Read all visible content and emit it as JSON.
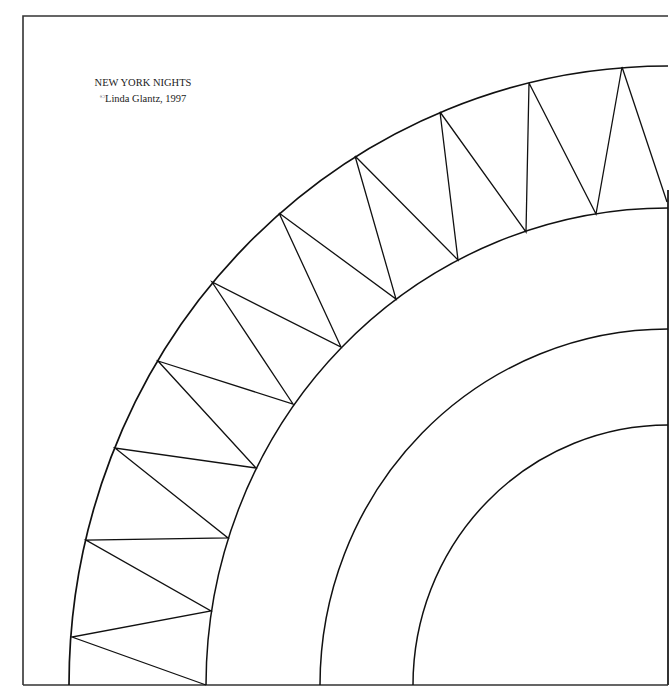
{
  "caption": {
    "title": "NEW YORK NIGHTS",
    "copyright_symbol": "©",
    "credit": "Linda Glantz, 1997"
  },
  "colors": {
    "background": "#ffffff",
    "line": "#111111",
    "border": "#333333"
  },
  "pattern": {
    "name": "quarter-circle quilt block",
    "frame": {
      "left": 23,
      "top": 16,
      "right": 668,
      "bottom": 685
    },
    "arc_center": {
      "x": 668,
      "y": 685
    },
    "arcs": [
      {
        "id": "outer-arc",
        "rx": 599,
        "ry": 619
      },
      {
        "id": "ring-inner-arc",
        "rx": 462,
        "ry": 477
      },
      {
        "id": "middle-arc",
        "rx": 348,
        "ry": 356
      },
      {
        "id": "innermost-arc",
        "rx": 255,
        "ry": 260
      }
    ],
    "zigzag_points": [
      [
        206,
        685
      ],
      [
        72,
        637
      ],
      [
        211,
        611
      ],
      [
        86,
        540
      ],
      [
        228,
        538
      ],
      [
        115,
        448
      ],
      [
        256,
        468
      ],
      [
        158,
        361
      ],
      [
        293,
        404
      ],
      [
        212,
        282
      ],
      [
        341,
        347
      ],
      [
        279,
        213
      ],
      [
        396,
        299
      ],
      [
        355,
        156
      ],
      [
        458,
        260
      ],
      [
        440,
        112
      ],
      [
        526,
        232
      ],
      [
        529,
        83
      ],
      [
        596,
        214
      ],
      [
        622,
        67
      ],
      [
        667,
        202
      ]
    ]
  }
}
